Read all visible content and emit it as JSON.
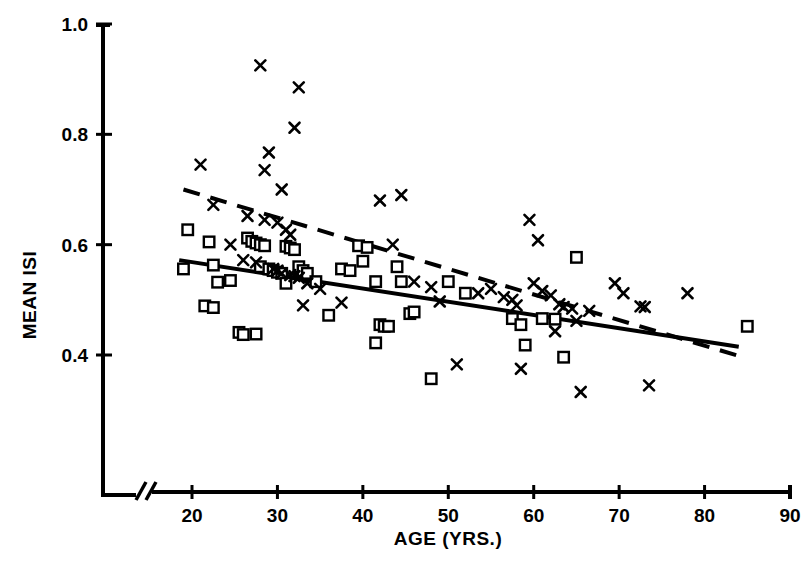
{
  "chart_data": {
    "type": "scatter",
    "title": "",
    "xlabel": "AGE  (YRS.)",
    "ylabel": "MEAN ISI",
    "xlim": [
      15,
      90
    ],
    "ylim": [
      0.28,
      1.0
    ],
    "xticks": [
      20,
      30,
      40,
      50,
      60,
      70,
      80,
      90
    ],
    "xtick_labels": [
      "20",
      "30",
      "40",
      "50",
      "60",
      "70",
      "80",
      "90"
    ],
    "yticks": [
      0.4,
      0.6,
      0.8,
      1.0
    ],
    "ytick_labels": [
      "0.4",
      "0.6",
      "0.8",
      "1.0"
    ],
    "grid": false,
    "legend": "none",
    "axis_break_x": true,
    "marker_colors": {
      "squares": "#000000",
      "crosses": "#000000"
    },
    "series": [
      {
        "name": "squares",
        "marker": "open-square",
        "points": [
          [
            19.5,
            0.627
          ],
          [
            19.0,
            0.556
          ],
          [
            22.0,
            0.605
          ],
          [
            22.5,
            0.563
          ],
          [
            21.5,
            0.489
          ],
          [
            22.5,
            0.486
          ],
          [
            23.0,
            0.532
          ],
          [
            24.5,
            0.535
          ],
          [
            25.5,
            0.441
          ],
          [
            26.0,
            0.437
          ],
          [
            27.5,
            0.438
          ],
          [
            26.5,
            0.612
          ],
          [
            27.0,
            0.606
          ],
          [
            27.5,
            0.603
          ],
          [
            28.0,
            0.6
          ],
          [
            28.5,
            0.598
          ],
          [
            28.0,
            0.56
          ],
          [
            29.0,
            0.556
          ],
          [
            29.5,
            0.553
          ],
          [
            30.0,
            0.55
          ],
          [
            30.5,
            0.548
          ],
          [
            31.0,
            0.597
          ],
          [
            31.5,
            0.594
          ],
          [
            32.0,
            0.591
          ],
          [
            32.5,
            0.56
          ],
          [
            33.0,
            0.553
          ],
          [
            33.5,
            0.548
          ],
          [
            31.0,
            0.53
          ],
          [
            34.5,
            0.533
          ],
          [
            36.0,
            0.472
          ],
          [
            37.5,
            0.556
          ],
          [
            38.5,
            0.553
          ],
          [
            39.5,
            0.598
          ],
          [
            40.5,
            0.595
          ],
          [
            40.0,
            0.57
          ],
          [
            41.5,
            0.533
          ],
          [
            42.0,
            0.455
          ],
          [
            42.5,
            0.452
          ],
          [
            43.0,
            0.452
          ],
          [
            41.5,
            0.422
          ],
          [
            44.0,
            0.56
          ],
          [
            44.5,
            0.533
          ],
          [
            45.5,
            0.475
          ],
          [
            46.0,
            0.478
          ],
          [
            48.0,
            0.357
          ],
          [
            50.0,
            0.533
          ],
          [
            52.0,
            0.512
          ],
          [
            57.5,
            0.466
          ],
          [
            58.5,
            0.455
          ],
          [
            59.0,
            0.418
          ],
          [
            61.0,
            0.466
          ],
          [
            62.5,
            0.465
          ],
          [
            63.5,
            0.396
          ],
          [
            65.0,
            0.577
          ],
          [
            85.0,
            0.452
          ]
        ]
      },
      {
        "name": "crosses",
        "marker": "cross",
        "points": [
          [
            21.0,
            0.745
          ],
          [
            22.5,
            0.672
          ],
          [
            28.0,
            0.925
          ],
          [
            29.0,
            0.767
          ],
          [
            28.5,
            0.735
          ],
          [
            30.5,
            0.7
          ],
          [
            32.5,
            0.885
          ],
          [
            32.0,
            0.812
          ],
          [
            26.5,
            0.652
          ],
          [
            28.5,
            0.645
          ],
          [
            30.0,
            0.64
          ],
          [
            31.0,
            0.627
          ],
          [
            31.5,
            0.618
          ],
          [
            24.5,
            0.6
          ],
          [
            26.0,
            0.572
          ],
          [
            27.5,
            0.568
          ],
          [
            29.5,
            0.556
          ],
          [
            30.0,
            0.553
          ],
          [
            30.5,
            0.548
          ],
          [
            31.5,
            0.545
          ],
          [
            32.0,
            0.543
          ],
          [
            32.5,
            0.54
          ],
          [
            33.5,
            0.53
          ],
          [
            33.0,
            0.49
          ],
          [
            35.0,
            0.52
          ],
          [
            37.5,
            0.495
          ],
          [
            42.0,
            0.68
          ],
          [
            44.5,
            0.69
          ],
          [
            43.5,
            0.6
          ],
          [
            46.0,
            0.533
          ],
          [
            48.0,
            0.523
          ],
          [
            49.0,
            0.497
          ],
          [
            51.0,
            0.383
          ],
          [
            53.5,
            0.512
          ],
          [
            55.0,
            0.52
          ],
          [
            56.5,
            0.505
          ],
          [
            57.5,
            0.5
          ],
          [
            58.0,
            0.49
          ],
          [
            59.5,
            0.645
          ],
          [
            60.5,
            0.608
          ],
          [
            58.5,
            0.375
          ],
          [
            60.0,
            0.53
          ],
          [
            61.0,
            0.516
          ],
          [
            62.0,
            0.508
          ],
          [
            63.0,
            0.492
          ],
          [
            63.5,
            0.487
          ],
          [
            64.5,
            0.484
          ],
          [
            62.5,
            0.443
          ],
          [
            65.0,
            0.462
          ],
          [
            65.5,
            0.333
          ],
          [
            66.5,
            0.48
          ],
          [
            69.5,
            0.53
          ],
          [
            70.5,
            0.512
          ],
          [
            72.5,
            0.488
          ],
          [
            73.0,
            0.487
          ],
          [
            73.5,
            0.345
          ],
          [
            78.0,
            0.512
          ]
        ]
      }
    ],
    "trend_lines": [
      {
        "name": "solid-regression-line",
        "style": "solid",
        "x0": 18.5,
        "y0": 0.572,
        "x1": 84.0,
        "y1": 0.415
      },
      {
        "name": "dashed-regression-line",
        "style": "dashed",
        "x0": 19.0,
        "y0": 0.7,
        "x1": 84.5,
        "y1": 0.396
      }
    ]
  }
}
